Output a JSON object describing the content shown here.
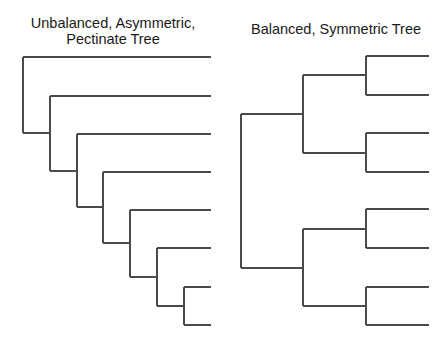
{
  "left_tree": {
    "title_line1": "Unbalanced, Asymmetric,",
    "title_line2": "Pectinate Tree",
    "leaf_count": 8
  },
  "right_tree": {
    "title": "Balanced, Symmetric Tree",
    "leaf_count": 8
  },
  "colors": {
    "line": "#4a4a4a",
    "text": "#1a1a1a",
    "background": "#ffffff"
  }
}
